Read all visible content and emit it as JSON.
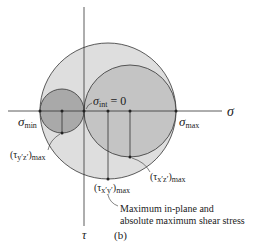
{
  "figure": {
    "panel_label": "(b)",
    "axes": {
      "horizontal": "σ",
      "vertical": "τ"
    },
    "labels": {
      "sigma_min": {
        "symbol": "σ",
        "sub": "min"
      },
      "sigma_max": {
        "symbol": "σ",
        "sub": "max"
      },
      "sigma_int": {
        "symbol": "σ",
        "sub": "int",
        "rest": " = 0"
      },
      "tau_yz": {
        "open": "(τ",
        "mid": "y′z′",
        "close": ")",
        "sub": "max"
      },
      "tau_xz": {
        "open": "(τ",
        "mid": "x′z′",
        "close": ")",
        "sub": "max"
      },
      "tau_xy": {
        "open": "(τ",
        "mid": "x′y′",
        "close": ")",
        "sub": "max"
      }
    },
    "annotation": {
      "line1": "Maximum in-plane and",
      "line2": "absolute maximum shear stress"
    },
    "colors": {
      "large_circle": "#dedede",
      "medium_circle": "#c4c4c4",
      "small_circle": "#a9a9a9",
      "stroke": "#333333"
    }
  }
}
